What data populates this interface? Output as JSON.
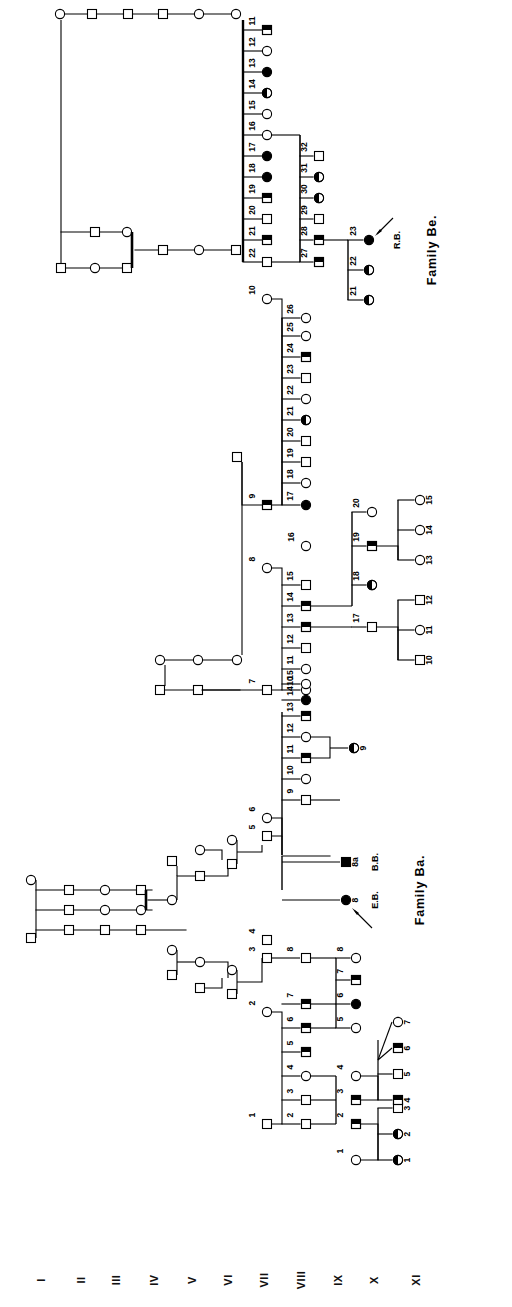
{
  "figure": {
    "type": "pedigree-chart",
    "orientation": "rotated-90-counterclockwise",
    "background": "#ffffff",
    "line_color": "#000000",
    "fill_color": "#000000"
  },
  "generation_labels": [
    "I",
    "II",
    "III",
    "IV",
    "V",
    "VI",
    "VII",
    "VIII",
    "IX",
    "X",
    "XI"
  ],
  "family_labels": [
    {
      "id": "family-be",
      "text": "Family Be."
    },
    {
      "id": "family-ba",
      "text": "Family Ba."
    }
  ],
  "proband_annotations": [
    {
      "id": "rb",
      "text": "R.B.",
      "individual": "23",
      "generation": "X",
      "family": "Family Be."
    },
    {
      "id": "eb",
      "text": "E.B.",
      "individual": "8",
      "generation": "X",
      "family": "Family Ba."
    },
    {
      "id": "bb",
      "text": "B.B.",
      "individual": "8a",
      "generation": "X",
      "family": "Family Ba."
    }
  ],
  "symbol_legend": {
    "square": "male",
    "circle": "female",
    "open": "unaffected",
    "half-filled": "carrier / partially affected",
    "filled": "affected"
  },
  "individuals": {
    "gen_VIII_be_sibship": [
      {
        "n": "11",
        "sex": "male",
        "fill": "half"
      },
      {
        "n": "12",
        "sex": "female",
        "fill": "open"
      },
      {
        "n": "13",
        "sex": "female",
        "fill": "full"
      },
      {
        "n": "14",
        "sex": "female",
        "fill": "half"
      },
      {
        "n": "15",
        "sex": "female",
        "fill": "open"
      },
      {
        "n": "16",
        "sex": "female",
        "fill": "open"
      },
      {
        "n": "17",
        "sex": "female",
        "fill": "full"
      },
      {
        "n": "18",
        "sex": "female",
        "fill": "full"
      },
      {
        "n": "19",
        "sex": "male",
        "fill": "half"
      },
      {
        "n": "20",
        "sex": "male",
        "fill": "open"
      },
      {
        "n": "21",
        "sex": "male",
        "fill": "half"
      },
      {
        "n": "22",
        "sex": "male",
        "fill": "open"
      }
    ],
    "gen_IX_be_sibship_27_32": [
      {
        "n": "27",
        "sex": "male",
        "fill": "half"
      },
      {
        "n": "28",
        "sex": "male",
        "fill": "half"
      },
      {
        "n": "29",
        "sex": "male",
        "fill": "open"
      },
      {
        "n": "30",
        "sex": "female",
        "fill": "half"
      },
      {
        "n": "31",
        "sex": "female",
        "fill": "half"
      },
      {
        "n": "32",
        "sex": "male",
        "fill": "open"
      }
    ],
    "gen_X_be_sibship_21_23": [
      {
        "n": "21",
        "sex": "female",
        "fill": "half"
      },
      {
        "n": "22",
        "sex": "female",
        "fill": "half"
      },
      {
        "n": "23",
        "sex": "female",
        "fill": "full"
      }
    ],
    "gen_VIII_parents_9_10": [
      {
        "n": "9",
        "sex": "male",
        "fill": "half"
      },
      {
        "n": "10",
        "sex": "female",
        "fill": "open"
      }
    ],
    "gen_IX_sibship_17_26": [
      {
        "n": "17",
        "sex": "female",
        "fill": "full"
      },
      {
        "n": "18",
        "sex": "female",
        "fill": "open"
      },
      {
        "n": "19",
        "sex": "male",
        "fill": "open"
      },
      {
        "n": "20",
        "sex": "male",
        "fill": "open"
      },
      {
        "n": "21",
        "sex": "female",
        "fill": "half"
      },
      {
        "n": "22",
        "sex": "female",
        "fill": "open"
      },
      {
        "n": "23",
        "sex": "male",
        "fill": "open"
      },
      {
        "n": "24",
        "sex": "male",
        "fill": "half"
      },
      {
        "n": "25",
        "sex": "female",
        "fill": "open"
      },
      {
        "n": "26",
        "sex": "female",
        "fill": "open"
      }
    ],
    "gen_VIII_parents_7_8": [
      {
        "n": "7",
        "sex": "male",
        "fill": "open"
      },
      {
        "n": "8",
        "sex": "female",
        "fill": "open"
      }
    ],
    "gen_IX_sibship_10_15": [
      {
        "n": "10",
        "sex": "female",
        "fill": "open"
      },
      {
        "n": "11",
        "sex": "female",
        "fill": "open"
      },
      {
        "n": "12",
        "sex": "male",
        "fill": "open"
      },
      {
        "n": "13",
        "sex": "male",
        "fill": "half"
      },
      {
        "n": "14",
        "sex": "male",
        "fill": "half"
      },
      {
        "n": "15",
        "sex": "male",
        "fill": "open"
      }
    ],
    "gen_IX_16": [
      {
        "n": "16",
        "sex": "female",
        "fill": "open"
      }
    ],
    "gen_X_sibship_17_20": [
      {
        "n": "17",
        "sex": "male",
        "fill": "open"
      },
      {
        "n": "18",
        "sex": "female",
        "fill": "half"
      },
      {
        "n": "19",
        "sex": "male",
        "fill": "half"
      },
      {
        "n": "20",
        "sex": "female",
        "fill": "open"
      }
    ],
    "gen_XI_sibship_10_12": [
      {
        "n": "10",
        "sex": "male",
        "fill": "open"
      },
      {
        "n": "11",
        "sex": "female",
        "fill": "open"
      },
      {
        "n": "12",
        "sex": "male",
        "fill": "open"
      }
    ],
    "gen_XI_sibship_13_15": [
      {
        "n": "13",
        "sex": "female",
        "fill": "open"
      },
      {
        "n": "14",
        "sex": "female",
        "fill": "open"
      },
      {
        "n": "15",
        "sex": "female",
        "fill": "open"
      }
    ],
    "gen_IX_ba_sibship_9_15": [
      {
        "n": "9",
        "sex": "male",
        "fill": "open"
      },
      {
        "n": "10",
        "sex": "female",
        "fill": "open"
      },
      {
        "n": "11",
        "sex": "male",
        "fill": "half"
      },
      {
        "n": "12",
        "sex": "female",
        "fill": "open"
      },
      {
        "n": "13",
        "sex": "male",
        "fill": "half"
      },
      {
        "n": "14",
        "sex": "female",
        "fill": "full"
      },
      {
        "n": "15",
        "sex": "female",
        "fill": "open"
      }
    ],
    "gen_X_ba_9": [
      {
        "n": "9",
        "sex": "female",
        "fill": "half"
      }
    ],
    "gen_X_ba_8": [
      {
        "n": "8",
        "sex": "female",
        "fill": "full",
        "code": "E.B."
      },
      {
        "n": "8a",
        "sex": "male",
        "fill": "full",
        "code": "B.B."
      }
    ],
    "gen_VIII_ba_parents_5_6": [
      {
        "n": "5",
        "sex": "male",
        "fill": "open"
      },
      {
        "n": "6",
        "sex": "female",
        "fill": "open"
      }
    ],
    "gen_VIII_ba_parents_1_2": [
      {
        "n": "1",
        "sex": "male",
        "fill": "open"
      },
      {
        "n": "2",
        "sex": "female",
        "fill": "open"
      }
    ],
    "gen_VIII_ba_3_4": [
      {
        "n": "3",
        "sex": "male",
        "fill": "open"
      },
      {
        "n": "4",
        "sex": "male",
        "fill": "open"
      }
    ],
    "gen_IX_ba_sibship_2_8": [
      {
        "n": "2",
        "sex": "male",
        "fill": "open"
      },
      {
        "n": "3",
        "sex": "male",
        "fill": "open"
      },
      {
        "n": "4",
        "sex": "female",
        "fill": "open"
      },
      {
        "n": "5",
        "sex": "male",
        "fill": "half"
      },
      {
        "n": "6",
        "sex": "male",
        "fill": "half"
      },
      {
        "n": "7",
        "sex": "male",
        "fill": "half"
      },
      {
        "n": "8",
        "sex": "male",
        "fill": "open"
      }
    ],
    "gen_X_ba_sibship_5_8": [
      {
        "n": "5",
        "sex": "female",
        "fill": "open"
      },
      {
        "n": "6",
        "sex": "female",
        "fill": "full"
      },
      {
        "n": "7",
        "sex": "male",
        "fill": "half"
      },
      {
        "n": "8",
        "sex": "female",
        "fill": "open"
      }
    ],
    "gen_X_ba_2_4": [
      {
        "n": "1",
        "sex": "female",
        "fill": "open"
      },
      {
        "n": "2",
        "sex": "male",
        "fill": "half"
      },
      {
        "n": "3",
        "sex": "male",
        "fill": "half"
      },
      {
        "n": "4",
        "sex": "female",
        "fill": "open"
      }
    ],
    "gen_XI_ba_sibship_1_3": [
      {
        "n": "1",
        "sex": "female",
        "fill": "half"
      },
      {
        "n": "2",
        "sex": "female",
        "fill": "half"
      },
      {
        "n": "3",
        "sex": "male",
        "fill": "open"
      }
    ],
    "gen_XI_ba_sibship_4_7": [
      {
        "n": "4",
        "sex": "male",
        "fill": "half"
      },
      {
        "n": "5",
        "sex": "male",
        "fill": "open"
      },
      {
        "n": "6",
        "sex": "male",
        "fill": "half"
      },
      {
        "n": "7",
        "sex": "female",
        "fill": "open"
      }
    ]
  }
}
